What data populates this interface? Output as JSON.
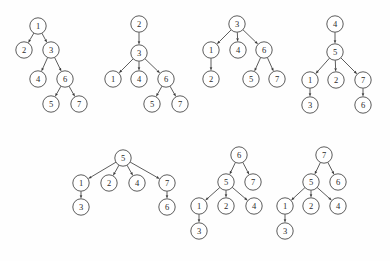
{
  "figure": {
    "title": "",
    "background_color": "#fefefe",
    "node_fill": "#ffffff",
    "node_stroke": "#4a4a4a",
    "edge_color": "#4a4a4a",
    "label_color": "#2b2b2b",
    "node_radius": 8.2,
    "width": 390,
    "height": 261
  },
  "trees": [
    {
      "name": "tree-1",
      "root": "1",
      "nodes": [
        {
          "id": "n1",
          "label": "1",
          "x": 38,
          "y": 26
        },
        {
          "id": "n2",
          "label": "2",
          "x": 24,
          "y": 50
        },
        {
          "id": "n3",
          "label": "3",
          "x": 51,
          "y": 50
        },
        {
          "id": "n4",
          "label": "4",
          "x": 38,
          "y": 79
        },
        {
          "id": "n6",
          "label": "6",
          "x": 65,
          "y": 79
        },
        {
          "id": "n5",
          "label": "5",
          "x": 51,
          "y": 104
        },
        {
          "id": "n7",
          "label": "7",
          "x": 79,
          "y": 104
        }
      ],
      "edges": [
        {
          "from": "n1",
          "to": "n2"
        },
        {
          "from": "n1",
          "to": "n3"
        },
        {
          "from": "n3",
          "to": "n4"
        },
        {
          "from": "n3",
          "to": "n6"
        },
        {
          "from": "n6",
          "to": "n5"
        },
        {
          "from": "n6",
          "to": "n7"
        }
      ]
    },
    {
      "name": "tree-2",
      "root": "2",
      "nodes": [
        {
          "id": "n2",
          "label": "2",
          "x": 139,
          "y": 24
        },
        {
          "id": "n3",
          "label": "3",
          "x": 139,
          "y": 53
        },
        {
          "id": "n1",
          "label": "1",
          "x": 113,
          "y": 79
        },
        {
          "id": "n4",
          "label": "4",
          "x": 139,
          "y": 79
        },
        {
          "id": "n6",
          "label": "6",
          "x": 166,
          "y": 79
        },
        {
          "id": "n5",
          "label": "5",
          "x": 152,
          "y": 104
        },
        {
          "id": "n7",
          "label": "7",
          "x": 180,
          "y": 104
        }
      ],
      "edges": [
        {
          "from": "n2",
          "to": "n3"
        },
        {
          "from": "n3",
          "to": "n1"
        },
        {
          "from": "n3",
          "to": "n4"
        },
        {
          "from": "n3",
          "to": "n6"
        },
        {
          "from": "n6",
          "to": "n5"
        },
        {
          "from": "n6",
          "to": "n7"
        }
      ]
    },
    {
      "name": "tree-3",
      "root": "3",
      "nodes": [
        {
          "id": "n3",
          "label": "3",
          "x": 237,
          "y": 24
        },
        {
          "id": "n1",
          "label": "1",
          "x": 211,
          "y": 50
        },
        {
          "id": "n4",
          "label": "4",
          "x": 238,
          "y": 50
        },
        {
          "id": "n6",
          "label": "6",
          "x": 264,
          "y": 50
        },
        {
          "id": "n2",
          "label": "2",
          "x": 211,
          "y": 79
        },
        {
          "id": "n5",
          "label": "5",
          "x": 251,
          "y": 79
        },
        {
          "id": "n7",
          "label": "7",
          "x": 277,
          "y": 79
        }
      ],
      "edges": [
        {
          "from": "n3",
          "to": "n1"
        },
        {
          "from": "n3",
          "to": "n4"
        },
        {
          "from": "n3",
          "to": "n6"
        },
        {
          "from": "n1",
          "to": "n2"
        },
        {
          "from": "n6",
          "to": "n5"
        },
        {
          "from": "n6",
          "to": "n7"
        }
      ]
    },
    {
      "name": "tree-4",
      "root": "4",
      "nodes": [
        {
          "id": "n4",
          "label": "4",
          "x": 335,
          "y": 24
        },
        {
          "id": "n5",
          "label": "5",
          "x": 335,
          "y": 52
        },
        {
          "id": "n1",
          "label": "1",
          "x": 310,
          "y": 80
        },
        {
          "id": "n2",
          "label": "2",
          "x": 336,
          "y": 80
        },
        {
          "id": "n7",
          "label": "7",
          "x": 363,
          "y": 80
        },
        {
          "id": "n3",
          "label": "3",
          "x": 310,
          "y": 105
        },
        {
          "id": "n6",
          "label": "6",
          "x": 363,
          "y": 105
        }
      ],
      "edges": [
        {
          "from": "n4",
          "to": "n5"
        },
        {
          "from": "n5",
          "to": "n1"
        },
        {
          "from": "n5",
          "to": "n2"
        },
        {
          "from": "n5",
          "to": "n7"
        },
        {
          "from": "n1",
          "to": "n3"
        },
        {
          "from": "n7",
          "to": "n6"
        }
      ]
    },
    {
      "name": "tree-5",
      "root": "5",
      "nodes": [
        {
          "id": "n5",
          "label": "5",
          "x": 123,
          "y": 158
        },
        {
          "id": "n1",
          "label": "1",
          "x": 81,
          "y": 183
        },
        {
          "id": "n2",
          "label": "2",
          "x": 109,
          "y": 183
        },
        {
          "id": "n4",
          "label": "4",
          "x": 137,
          "y": 183
        },
        {
          "id": "n7",
          "label": "7",
          "x": 167,
          "y": 183
        },
        {
          "id": "n3",
          "label": "3",
          "x": 81,
          "y": 207
        },
        {
          "id": "n6",
          "label": "6",
          "x": 167,
          "y": 207
        }
      ],
      "edges": [
        {
          "from": "n5",
          "to": "n1"
        },
        {
          "from": "n5",
          "to": "n2"
        },
        {
          "from": "n5",
          "to": "n4"
        },
        {
          "from": "n5",
          "to": "n7"
        },
        {
          "from": "n1",
          "to": "n3"
        },
        {
          "from": "n7",
          "to": "n6"
        }
      ]
    },
    {
      "name": "tree-6",
      "root": "6",
      "nodes": [
        {
          "id": "n6",
          "label": "6",
          "x": 239,
          "y": 155
        },
        {
          "id": "n5",
          "label": "5",
          "x": 226,
          "y": 182
        },
        {
          "id": "n7",
          "label": "7",
          "x": 253,
          "y": 182
        },
        {
          "id": "n1",
          "label": "1",
          "x": 199,
          "y": 206
        },
        {
          "id": "n2",
          "label": "2",
          "x": 226,
          "y": 206
        },
        {
          "id": "n4",
          "label": "4",
          "x": 254,
          "y": 206
        },
        {
          "id": "n3",
          "label": "3",
          "x": 199,
          "y": 231
        }
      ],
      "edges": [
        {
          "from": "n6",
          "to": "n5"
        },
        {
          "from": "n6",
          "to": "n7"
        },
        {
          "from": "n5",
          "to": "n1"
        },
        {
          "from": "n5",
          "to": "n2"
        },
        {
          "from": "n5",
          "to": "n4"
        },
        {
          "from": "n1",
          "to": "n3"
        }
      ]
    },
    {
      "name": "tree-7",
      "root": "7",
      "nodes": [
        {
          "id": "n7",
          "label": "7",
          "x": 324,
          "y": 155
        },
        {
          "id": "n5",
          "label": "5",
          "x": 311,
          "y": 182
        },
        {
          "id": "n6",
          "label": "6",
          "x": 338,
          "y": 182
        },
        {
          "id": "n1",
          "label": "1",
          "x": 285,
          "y": 206
        },
        {
          "id": "n2",
          "label": "2",
          "x": 311,
          "y": 206
        },
        {
          "id": "n4",
          "label": "4",
          "x": 338,
          "y": 206
        },
        {
          "id": "n3",
          "label": "3",
          "x": 285,
          "y": 231
        }
      ],
      "edges": [
        {
          "from": "n7",
          "to": "n5"
        },
        {
          "from": "n7",
          "to": "n6"
        },
        {
          "from": "n5",
          "to": "n1"
        },
        {
          "from": "n5",
          "to": "n2"
        },
        {
          "from": "n5",
          "to": "n4"
        },
        {
          "from": "n1",
          "to": "n3"
        }
      ]
    }
  ]
}
